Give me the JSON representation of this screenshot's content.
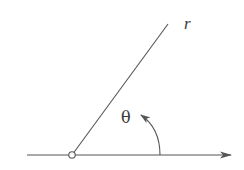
{
  "diagram": {
    "type": "polar-coordinate-angle",
    "labels": {
      "radius": "r",
      "angle": "θ"
    },
    "colors": {
      "stroke": "#555555",
      "text": "#3a3a3a",
      "background": "#ffffff"
    },
    "elements": {
      "polar_axis": {
        "x1": 27,
        "y1": 155,
        "x2": 231,
        "y2": 155,
        "arrow": "end"
      },
      "origin": {
        "cx": 72,
        "cy": 155,
        "r": 3.2
      },
      "ray": {
        "x1": 72,
        "y1": 155,
        "x2": 168,
        "y2": 24
      },
      "angle_arc": {
        "from": [
          160,
          155
        ],
        "to": [
          141,
          115
        ],
        "arrow": "end"
      }
    }
  }
}
